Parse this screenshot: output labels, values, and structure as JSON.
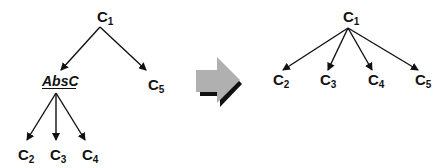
{
  "diagram": {
    "left_tree": {
      "root": {
        "base": "C",
        "sub": "1"
      },
      "abstract_node": {
        "label": "AbsC"
      },
      "right_child": {
        "base": "C",
        "sub": "5"
      },
      "leaves": [
        {
          "base": "C",
          "sub": "2"
        },
        {
          "base": "C",
          "sub": "3"
        },
        {
          "base": "C",
          "sub": "4"
        }
      ]
    },
    "transform_arrow": {
      "icon": "block-right-arrow-icon",
      "fill": "#b0b0b0",
      "shadow": "#111111"
    },
    "right_tree": {
      "root": {
        "base": "C",
        "sub": "1"
      },
      "children": [
        {
          "base": "C",
          "sub": "2"
        },
        {
          "base": "C",
          "sub": "3"
        },
        {
          "base": "C",
          "sub": "4"
        },
        {
          "base": "C",
          "sub": "5"
        }
      ]
    },
    "colors": {
      "line": "#111111",
      "text": "#111111",
      "background": "#ffffff"
    }
  }
}
